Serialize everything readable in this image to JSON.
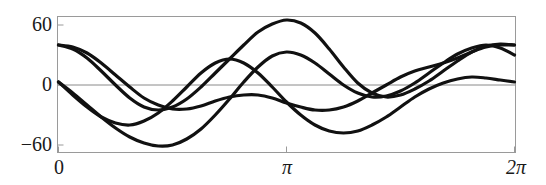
{
  "chart_data": {
    "type": "line",
    "title": "",
    "xlabel": "",
    "ylabel": "",
    "xlim": [
      0,
      6.283185307179586
    ],
    "ylim": [
      -68,
      68
    ],
    "grid": false,
    "legend": null,
    "axis_frame": true,
    "x_ticks": [
      {
        "value": 0,
        "label": "0"
      },
      {
        "value": 3.141592653589793,
        "label": "π"
      },
      {
        "value": 6.283185307179586,
        "label": "2π"
      }
    ],
    "y_ticks": [
      {
        "value": 60,
        "label": "60"
      },
      {
        "value": 0,
        "label": "0"
      },
      {
        "value": -60,
        "label": "−60"
      }
    ],
    "x": [
      0.0,
      0.19634954,
      0.39269908,
      0.58904862,
      0.78539816,
      0.9817477,
      1.17809725,
      1.37444679,
      1.57079633,
      1.76714587,
      1.96349541,
      2.15984495,
      2.35619449,
      2.55254403,
      2.74889357,
      2.94524311,
      3.14159265,
      3.33794219,
      3.53429174,
      3.73064128,
      3.92699082,
      4.12334036,
      4.3196899,
      4.51603944,
      4.71238898,
      4.90873852,
      5.10508806,
      5.3014376,
      5.49778714,
      5.69413668,
      5.89048623,
      6.08683577,
      6.28318531
    ],
    "series": [
      {
        "name": "curve-1",
        "color": "#111111",
        "values": [
          40,
          38,
          32,
          22,
          10,
          -2,
          -13,
          -20,
          -24,
          -24,
          -21,
          -16,
          -12,
          -10,
          -10,
          -13,
          -18,
          -22,
          -25,
          -25,
          -22,
          -16,
          -8,
          0,
          8,
          14,
          18,
          22,
          27,
          33,
          38,
          40,
          40
        ]
      },
      {
        "name": "curve-2",
        "color": "#111111",
        "values": [
          3,
          -8,
          -20,
          -32,
          -43,
          -52,
          -58,
          -61,
          -60,
          -54,
          -44,
          -30,
          -14,
          3,
          18,
          29,
          33,
          30,
          22,
          11,
          0,
          -8,
          -12,
          -11,
          -6,
          2,
          12,
          22,
          31,
          37,
          40,
          37,
          30
        ]
      },
      {
        "name": "curve-3",
        "color": "#111111",
        "values": [
          3,
          -10,
          -22,
          -32,
          -38,
          -40,
          -36,
          -28,
          -16,
          -2,
          12,
          22,
          26,
          22,
          12,
          -2,
          -17,
          -30,
          -40,
          -46,
          -48,
          -46,
          -40,
          -32,
          -22,
          -12,
          -4,
          2,
          6,
          8,
          7,
          5,
          3
        ]
      },
      {
        "name": "curve-4",
        "color": "#111111",
        "values": [
          40,
          36,
          27,
          14,
          0,
          -13,
          -22,
          -25,
          -22,
          -14,
          -2,
          12,
          26,
          40,
          53,
          61,
          65,
          62,
          52,
          36,
          18,
          2,
          -8,
          -12,
          -10,
          -4,
          4,
          14,
          24,
          33,
          39,
          41,
          40
        ]
      }
    ]
  },
  "axes": {
    "zero_line_color": "#8a8a8a",
    "frame_color": "#9a9a9a",
    "curve_color": "#111111"
  }
}
